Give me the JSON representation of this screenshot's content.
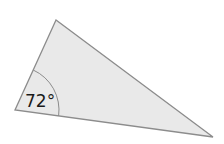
{
  "diagram": {
    "type": "triangle",
    "vertices": {
      "top": {
        "x": 56,
        "y": 20
      },
      "left": {
        "x": 15,
        "y": 110
      },
      "right": {
        "x": 213,
        "y": 137
      }
    },
    "fill_color": "#e9e9e9",
    "stroke_color": "#8c8c8c",
    "angle_marker": {
      "vertex": "left",
      "label": "72°",
      "arc_radius": 44
    }
  }
}
